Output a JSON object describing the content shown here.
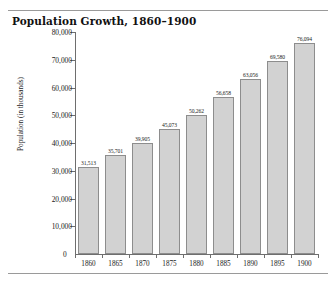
{
  "figure": {
    "title": "Population Growth, 1860–1900",
    "zero_label": "0"
  },
  "chart_data": {
    "type": "bar",
    "title": "Population Growth, 1860–1900",
    "xlabel": "",
    "ylabel": "Population (in thousands)",
    "categories": [
      "1860",
      "1865",
      "1870",
      "1875",
      "1880",
      "1885",
      "1890",
      "1895",
      "1900"
    ],
    "values": [
      31513,
      35701,
      39905,
      45073,
      50262,
      56658,
      63056,
      69580,
      76094
    ],
    "value_labels": [
      "31,513",
      "35,701",
      "39,905",
      "45,073",
      "50,262",
      "56,658",
      "63,056",
      "69,580",
      "76,094"
    ],
    "ylim": [
      0,
      80000
    ],
    "ytick_values": [
      10000,
      20000,
      30000,
      40000,
      50000,
      60000,
      70000,
      80000
    ],
    "ytick_labels": [
      "10,000",
      "20,000",
      "30,000",
      "40,000",
      "50,000",
      "60,000",
      "70,000",
      "80,000"
    ],
    "grid": false,
    "legend": null,
    "bar_color": "#d2d2d2",
    "bar_border_color": "#8d8d8d",
    "axis_color": "#6e6e6e"
  }
}
